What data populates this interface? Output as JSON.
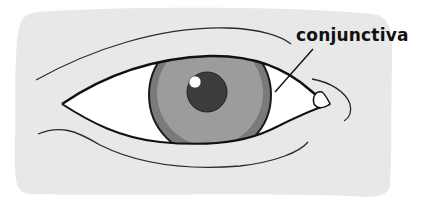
{
  "diagram": {
    "labels": [
      {
        "text": "conjunctiva",
        "target": "conjunctiva"
      }
    ]
  },
  "colors": {
    "background_panel": "#e8e8e8",
    "outline": "#1a1a1a",
    "sclera": "#ffffff",
    "iris_outer": "#7a7a7a",
    "iris_inner": "#9a9a9a",
    "pupil": "#3c3c3c",
    "highlight": "#ffffff",
    "label_text": "#111111"
  }
}
